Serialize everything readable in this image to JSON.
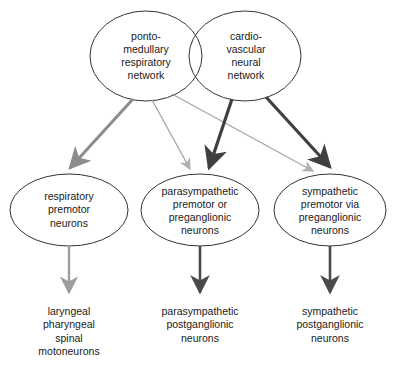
{
  "diagram": {
    "type": "flow-diagram",
    "background_color": "#ffffff",
    "colors": {
      "node_stroke": "#333333",
      "text": "#1a1a1a",
      "respiratory_arrow": "#8c8c8c",
      "respiratory_arrow_faint": "#b0b0b0",
      "cardiovascular_arrow": "#404040",
      "output_arrow_light": "#9e9e9e",
      "output_arrow_dark": "#4a4a4a"
    },
    "nodes": {
      "top": [
        {
          "id": "ponto-medullary-respiratory-network",
          "label": "ponto-\nmedullary\nrespiratory\nnetwork",
          "shape": "ellipse"
        },
        {
          "id": "cardiovascular-neural-network",
          "label": "cardio-\nvascular\nneural\nnetwork",
          "shape": "ellipse"
        }
      ],
      "middle": [
        {
          "id": "respiratory-premotor-neurons",
          "label": "respiratory\npremotor\nneurons",
          "shape": "ellipse"
        },
        {
          "id": "parasympathetic-premotor-preganglionic-neurons",
          "label": "parasympathetic\npremotor or\npreganglionic\nneurons",
          "shape": "ellipse"
        },
        {
          "id": "sympathetic-premotor-preganglionic-neurons",
          "label": "sympathetic\npremotor via\npreganglionic\nneurons",
          "shape": "ellipse"
        }
      ],
      "bottom": [
        {
          "id": "laryngeal-pharyngeal-spinal-motoneurons",
          "label": "laryngeal\npharyngeal\nspinal\nmotoneurons",
          "shape": "text"
        },
        {
          "id": "parasympathetic-postganglionic-neurons",
          "label": "parasympathetic\npostganglionic\nneurons",
          "shape": "text"
        },
        {
          "id": "sympathetic-postganglionic-neurons",
          "label": "sympathetic\npostganglionic\nneurons",
          "shape": "text"
        }
      ]
    },
    "edges": [
      {
        "from": "ponto-medullary-respiratory-network",
        "to": "respiratory-premotor-neurons",
        "style": "thick-gray"
      },
      {
        "from": "ponto-medullary-respiratory-network",
        "to": "parasympathetic-premotor-preganglionic-neurons",
        "style": "thin-gray"
      },
      {
        "from": "ponto-medullary-respiratory-network",
        "to": "sympathetic-premotor-preganglionic-neurons",
        "style": "thin-gray"
      },
      {
        "from": "cardiovascular-neural-network",
        "to": "parasympathetic-premotor-preganglionic-neurons",
        "style": "thick-dark"
      },
      {
        "from": "cardiovascular-neural-network",
        "to": "sympathetic-premotor-preganglionic-neurons",
        "style": "thick-dark"
      },
      {
        "from": "respiratory-premotor-neurons",
        "to": "laryngeal-pharyngeal-spinal-motoneurons",
        "style": "vertical-light"
      },
      {
        "from": "parasympathetic-premotor-preganglionic-neurons",
        "to": "parasympathetic-postganglionic-neurons",
        "style": "vertical-dark"
      },
      {
        "from": "sympathetic-premotor-preganglionic-neurons",
        "to": "sympathetic-postganglionic-neurons",
        "style": "vertical-dark"
      }
    ]
  }
}
